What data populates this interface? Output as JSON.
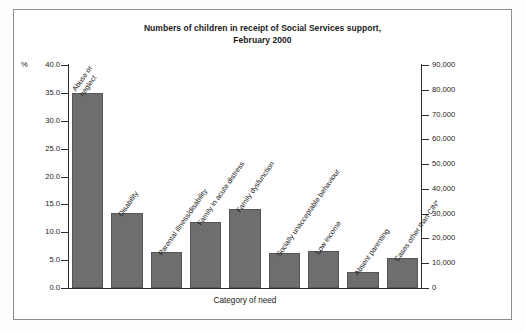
{
  "figure": {
    "title_line1": "Numbers of children in receipt of Social Services support,",
    "title_line2": "February 2000",
    "xlabel": "Category of need",
    "percent_symbol": "%"
  },
  "chart_data": {
    "type": "bar",
    "title": "Numbers of children in receipt of Social Services support, February 2000",
    "xlabel": "Category of need",
    "ylabel": "%",
    "ylabel_right": "",
    "categories": [
      "Abuse or neglect",
      "Disability",
      "Parental illness/disability",
      "Family in acute distress",
      "Family dysfunction",
      "Socially unacceptable behaviour",
      "Low income",
      "Absent parenting",
      "Cases other than CIN*"
    ],
    "category_lines": [
      [
        "Abuse or",
        "neglect"
      ],
      [
        "Disability"
      ],
      [
        "Parental illness/disability"
      ],
      [
        "Family in acute distress"
      ],
      [
        "Family dysfunction"
      ],
      [
        "Socially unacceptable behaviour"
      ],
      [
        "Low income"
      ],
      [
        "Absent parenting"
      ],
      [
        "Cases other than CIN*"
      ]
    ],
    "values": [
      34.9,
      13.4,
      6.4,
      11.8,
      14.1,
      6.3,
      6.6,
      2.9,
      5.3
    ],
    "values_right_axis": [
      78500,
      30000,
      14400,
      26600,
      31800,
      14200,
      14900,
      6500,
      12000
    ],
    "ylim": [
      0,
      40
    ],
    "ylim_right": [
      0,
      90000
    ],
    "yticks": [
      "0.0",
      "5.0",
      "10.0",
      "15.0",
      "20.0",
      "25.0",
      "30.0",
      "35.0",
      "40.0"
    ],
    "yticks_right": [
      "0",
      "10,000",
      "20,000",
      "30,000",
      "40,000",
      "50,000",
      "60,000",
      "70,000",
      "80,000",
      "90,000"
    ],
    "grid": false,
    "legend": false,
    "bar_color": "#6e6e6e"
  }
}
